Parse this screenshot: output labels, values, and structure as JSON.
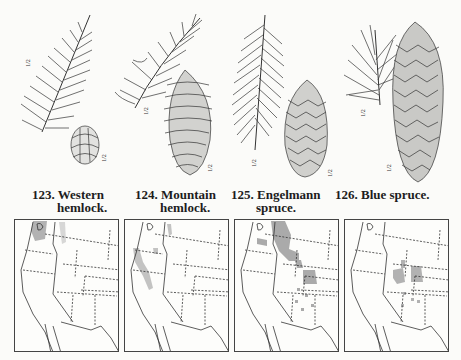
{
  "figures": [
    {
      "number": "123.",
      "line1": "Western",
      "line2": "hemlock.",
      "scale_labels": [
        "1/2",
        "1/2"
      ],
      "icons": [
        "hemlock-branch-icon",
        "hemlock-cone-icon"
      ]
    },
    {
      "number": "124.",
      "line1": "Mountain",
      "line2": "hemlock.",
      "scale_labels": [
        "1/2",
        "1/2"
      ],
      "icons": [
        "hemlock-branch-icon",
        "hemlock-cone-icon"
      ]
    },
    {
      "number": "125.",
      "line1": "Engelmann",
      "line2": "spruce.",
      "scale_labels": [
        "1/2",
        "1/2"
      ],
      "icons": [
        "spruce-branch-icon",
        "spruce-cone-icon"
      ]
    },
    {
      "number": "126.",
      "line1": "Blue spruce.",
      "line2": "",
      "scale_labels": [
        "1/2",
        "1/2"
      ],
      "icons": [
        "spruce-branch-icon",
        "spruce-cone-icon"
      ]
    }
  ],
  "maps": [
    {
      "species": "Western hemlock",
      "range_color": "#9a9a9a",
      "range_regions": [
        "Pacific Northwest coast",
        "Northern Idaho"
      ]
    },
    {
      "species": "Mountain hemlock",
      "range_color": "#b0b0b0",
      "range_regions": [
        "Cascades",
        "Sierra Nevada",
        "Northern Rockies"
      ]
    },
    {
      "species": "Engelmann spruce",
      "range_color": "#8f8f8f",
      "range_regions": [
        "Northern Rockies",
        "Central Rockies",
        "Southwest mountains"
      ]
    },
    {
      "species": "Blue spruce",
      "range_color": "#9a9a9a",
      "range_regions": [
        "Central Rockies",
        "Southwest mountains"
      ]
    }
  ]
}
